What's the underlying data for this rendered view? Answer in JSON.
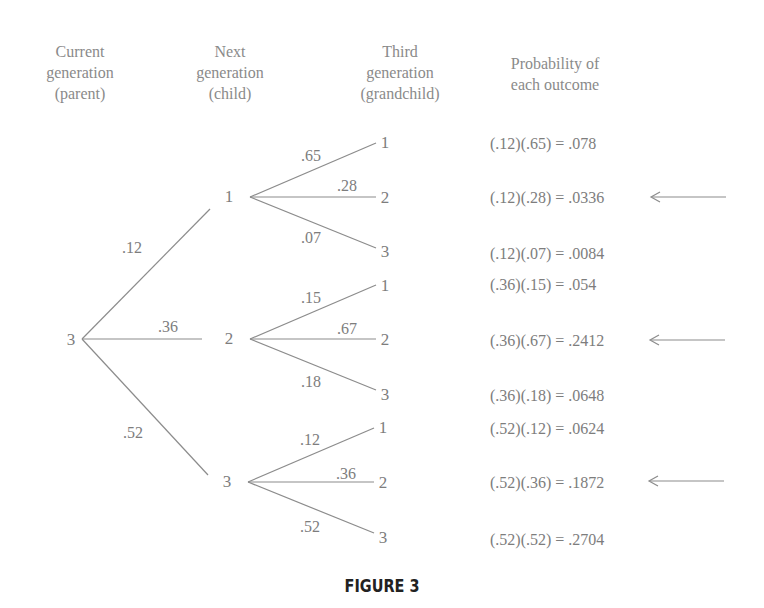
{
  "headers": {
    "current": [
      "Current",
      "generation",
      "(parent)"
    ],
    "next": [
      "Next",
      "generation",
      "(child)"
    ],
    "third": [
      "Third",
      "generation",
      "(grandchild)"
    ],
    "probability": [
      "Probability of",
      "each outcome"
    ]
  },
  "root": {
    "label": "3"
  },
  "children": [
    {
      "label": "1",
      "prob": ".12",
      "grandchildren": [
        {
          "label": "1",
          "prob": ".65",
          "outcome": "(.12)(.65) = .078",
          "highlighted": false
        },
        {
          "label": "2",
          "prob": ".28",
          "outcome": "(.12)(.28) = .0336",
          "highlighted": true
        },
        {
          "label": "3",
          "prob": ".07",
          "outcome": "(.12)(.07) = .0084",
          "highlighted": false
        }
      ]
    },
    {
      "label": "2",
      "prob": ".36",
      "grandchildren": [
        {
          "label": "1",
          "prob": ".15",
          "outcome": "(.36)(.15) = .054",
          "highlighted": false
        },
        {
          "label": "2",
          "prob": ".67",
          "outcome": "(.36)(.67) = .2412",
          "highlighted": true
        },
        {
          "label": "3",
          "prob": ".18",
          "outcome": "(.36)(.18) = .0648",
          "highlighted": false
        }
      ]
    },
    {
      "label": "3",
      "prob": ".52",
      "grandchildren": [
        {
          "label": "1",
          "prob": ".12",
          "outcome": "(.52)(.12) = .0624",
          "highlighted": false
        },
        {
          "label": "2",
          "prob": ".36",
          "outcome": "(.52)(.36) = .1872",
          "highlighted": true
        },
        {
          "label": "3",
          "prob": ".52",
          "outcome": "(.52)(.52) = .2704",
          "highlighted": false
        }
      ]
    }
  ],
  "caption": "FIGURE 3",
  "colors": {
    "line": "#8c8c8c",
    "text": "#7d7d7d",
    "caption": "#222222"
  }
}
